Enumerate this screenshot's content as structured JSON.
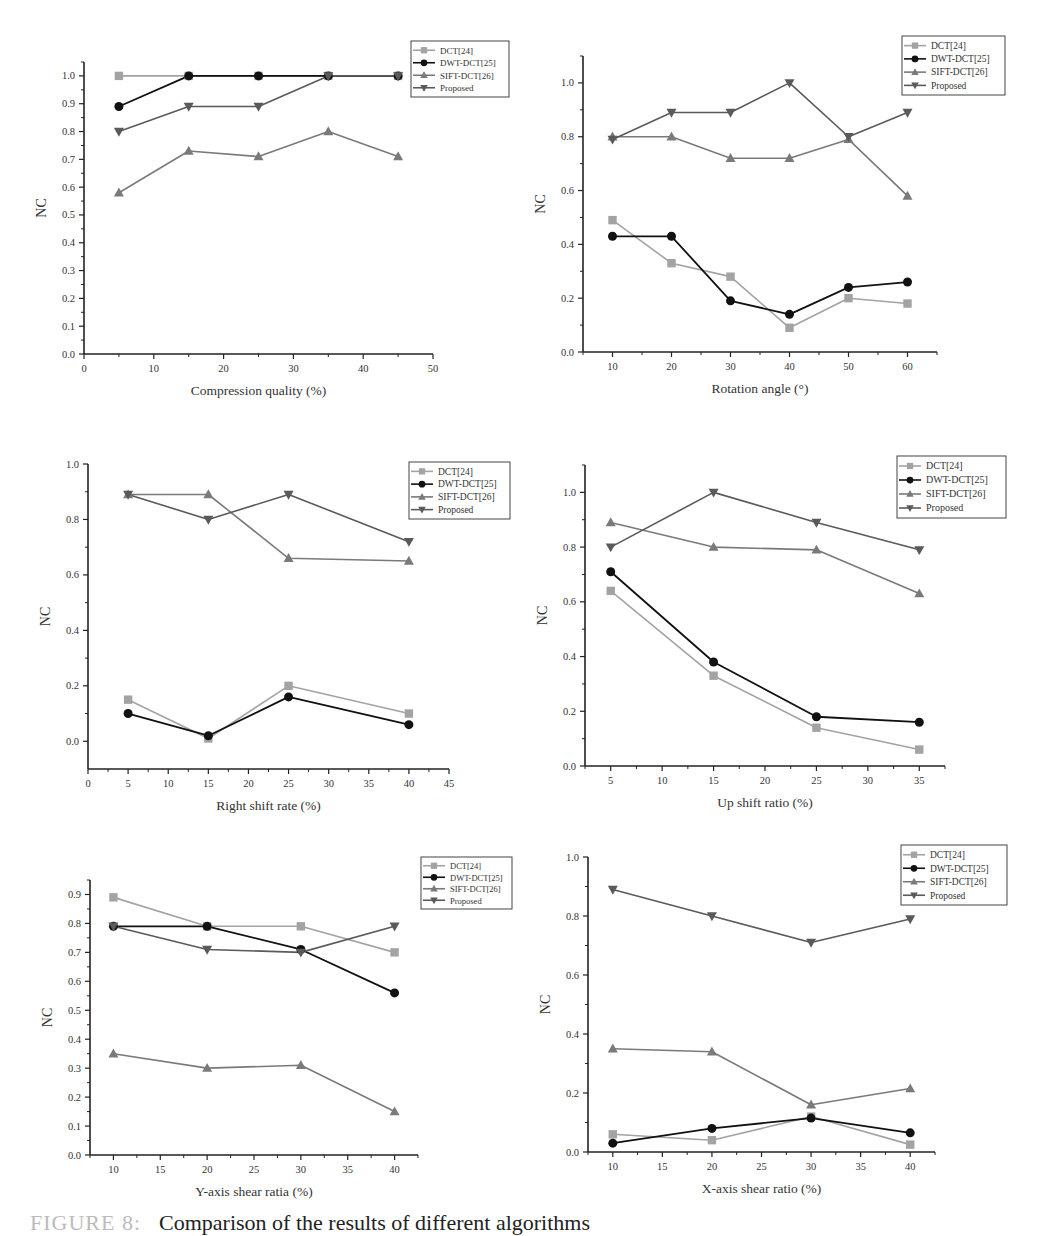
{
  "figure": {
    "caption_label": "FIGURE 8:",
    "caption_text": "Comparison of the results of different algorithms"
  },
  "legend_labels": [
    "DCT[24]",
    "DWT-DCT[25]",
    "SIFT-DCT[26]",
    "Proposed"
  ],
  "series_styles": [
    {
      "name": "DCT[24]",
      "color": "#a3a3a3",
      "marker": "square"
    },
    {
      "name": "DWT-DCT[25]",
      "color": "#111111",
      "marker": "circle"
    },
    {
      "name": "SIFT-DCT[26]",
      "color": "#7a7a7a",
      "marker": "triangle-up"
    },
    {
      "name": "Proposed",
      "color": "#5a5a5a",
      "marker": "triangle-down"
    }
  ],
  "chart_data": [
    {
      "type": "line",
      "title": "",
      "xlabel": "Compression quality (%)",
      "ylabel": "NC",
      "x": [
        5,
        15,
        25,
        35,
        45
      ],
      "xlim": [
        0,
        50
      ],
      "xticks": [
        0,
        10,
        20,
        30,
        40,
        50
      ],
      "ylim": [
        0,
        1.05
      ],
      "yticks": [
        0.0,
        0.1,
        0.2,
        0.3,
        0.4,
        0.5,
        0.6,
        0.7,
        0.8,
        0.9,
        1.0
      ],
      "ytick_labels": [
        "0.0",
        "0.1",
        "0.2",
        "0.3",
        "0.4",
        "0.5",
        "0.6",
        "0.7",
        "0.8",
        "0.9",
        "1.0"
      ],
      "grid": false,
      "legend": "top-right",
      "series": [
        {
          "name": "DCT[24]",
          "values": [
            1.0,
            1.0,
            1.0,
            1.0,
            1.0
          ]
        },
        {
          "name": "DWT-DCT[25]",
          "values": [
            0.89,
            1.0,
            1.0,
            1.0,
            1.0
          ]
        },
        {
          "name": "SIFT-DCT[26]",
          "values": [
            0.58,
            0.73,
            0.71,
            0.8,
            0.71
          ]
        },
        {
          "name": "Proposed",
          "values": [
            0.8,
            0.89,
            0.89,
            1.0,
            1.0
          ]
        }
      ]
    },
    {
      "type": "line",
      "title": "",
      "xlabel": "Rotation angle (°)",
      "ylabel": "NC",
      "x": [
        10,
        20,
        30,
        40,
        50,
        60
      ],
      "xlim": [
        5,
        65
      ],
      "xticks": [
        10,
        20,
        30,
        40,
        50,
        60
      ],
      "ylim": [
        0,
        1.1
      ],
      "yticks": [
        0.0,
        0.2,
        0.4,
        0.6,
        0.8,
        1.0
      ],
      "ytick_labels": [
        "0.0",
        "0.2",
        "0.4",
        "0.6",
        "0.8",
        "1.0"
      ],
      "grid": false,
      "legend": "top-right",
      "series": [
        {
          "name": "DCT[24]",
          "values": [
            0.49,
            0.33,
            0.28,
            0.09,
            0.2,
            0.18
          ]
        },
        {
          "name": "DWT-DCT[25]",
          "values": [
            0.43,
            0.43,
            0.19,
            0.14,
            0.24,
            0.26
          ]
        },
        {
          "name": "SIFT-DCT[26]",
          "values": [
            0.8,
            0.8,
            0.72,
            0.72,
            0.79,
            0.58
          ]
        },
        {
          "name": "Proposed",
          "values": [
            0.79,
            0.89,
            0.89,
            1.0,
            0.8,
            0.89
          ]
        }
      ]
    },
    {
      "type": "line",
      "title": "",
      "xlabel": "Right shift rate (%)",
      "ylabel": "NC",
      "x": [
        5,
        15,
        25,
        40
      ],
      "xlim": [
        0,
        45
      ],
      "xticks": [
        0,
        5,
        10,
        15,
        20,
        25,
        30,
        35,
        40,
        45
      ],
      "ylim": [
        -0.1,
        1.0
      ],
      "yticks": [
        0.0,
        0.2,
        0.4,
        0.6,
        0.8,
        1.0
      ],
      "ytick_labels": [
        "0.0",
        "0.2",
        "0.4",
        "0.6",
        "0.8",
        "1.0"
      ],
      "grid": false,
      "legend": "top-right",
      "series": [
        {
          "name": "DCT[24]",
          "values": [
            0.15,
            0.01,
            0.2,
            0.1
          ]
        },
        {
          "name": "DWT-DCT[25]",
          "values": [
            0.1,
            0.02,
            0.16,
            0.06
          ]
        },
        {
          "name": "SIFT-DCT[26]",
          "values": [
            0.89,
            0.89,
            0.66,
            0.65
          ]
        },
        {
          "name": "Proposed",
          "values": [
            0.89,
            0.8,
            0.89,
            0.72
          ]
        }
      ]
    },
    {
      "type": "line",
      "title": "",
      "xlabel": "Up shift ratio (%)",
      "ylabel": "NC",
      "x": [
        5,
        15,
        25,
        35
      ],
      "xlim": [
        2.5,
        37.5
      ],
      "xticks": [
        5,
        10,
        15,
        20,
        25,
        30,
        35
      ],
      "ylim": [
        0,
        1.1
      ],
      "yticks": [
        0.0,
        0.2,
        0.4,
        0.6,
        0.8,
        1.0
      ],
      "ytick_labels": [
        "0.0",
        "0.2",
        "0.4",
        "0.6",
        "0.8",
        "1.0"
      ],
      "grid": false,
      "legend": "top-right",
      "series": [
        {
          "name": "DCT[24]",
          "values": [
            0.64,
            0.33,
            0.14,
            0.06
          ]
        },
        {
          "name": "DWT-DCT[25]",
          "values": [
            0.71,
            0.38,
            0.18,
            0.16
          ]
        },
        {
          "name": "SIFT-DCT[26]",
          "values": [
            0.89,
            0.8,
            0.79,
            0.63
          ]
        },
        {
          "name": "Proposed",
          "values": [
            0.8,
            1.0,
            0.89,
            0.79
          ]
        }
      ]
    },
    {
      "type": "line",
      "title": "",
      "xlabel": "Y-axis shear ratia (%)",
      "ylabel": "NC",
      "x": [
        10,
        20,
        30,
        40
      ],
      "xlim": [
        7.5,
        42.5
      ],
      "xticks": [
        10,
        15,
        20,
        25,
        30,
        35,
        40
      ],
      "ylim": [
        0,
        0.95
      ],
      "yticks": [
        0.0,
        0.1,
        0.2,
        0.3,
        0.4,
        0.5,
        0.6,
        0.7,
        0.8,
        0.9
      ],
      "ytick_labels": [
        "0.0",
        "0.1",
        "0.2",
        "0.3",
        "0.4",
        "0.5",
        "0.6",
        "0.7",
        "0.8",
        "0.9"
      ],
      "grid": false,
      "legend": "top-right",
      "series": [
        {
          "name": "DCT[24]",
          "values": [
            0.89,
            0.79,
            0.79,
            0.7
          ]
        },
        {
          "name": "DWT-DCT[25]",
          "values": [
            0.79,
            0.79,
            0.71,
            0.56
          ]
        },
        {
          "name": "SIFT-DCT[26]",
          "values": [
            0.35,
            0.3,
            0.31,
            0.15
          ]
        },
        {
          "name": "Proposed",
          "values": [
            0.79,
            0.71,
            0.7,
            0.79
          ]
        }
      ]
    },
    {
      "type": "line",
      "title": "",
      "xlabel": "X-axis shear ratio (%)",
      "ylabel": "NC",
      "x": [
        10,
        20,
        30,
        40
      ],
      "xlim": [
        7.5,
        42.5
      ],
      "xticks": [
        10,
        15,
        20,
        25,
        30,
        35,
        40
      ],
      "ylim": [
        0,
        1.0
      ],
      "yticks": [
        0.0,
        0.2,
        0.4,
        0.6,
        0.8,
        1.0
      ],
      "ytick_labels": [
        "0.0",
        "0.2",
        "0.4",
        "0.6",
        "0.8",
        "1.0"
      ],
      "grid": false,
      "legend": "top-right",
      "series": [
        {
          "name": "DCT[24]",
          "values": [
            0.06,
            0.04,
            0.12,
            0.025
          ]
        },
        {
          "name": "DWT-DCT[25]",
          "values": [
            0.03,
            0.08,
            0.115,
            0.065
          ]
        },
        {
          "name": "SIFT-DCT[26]",
          "values": [
            0.35,
            0.34,
            0.16,
            0.215
          ]
        },
        {
          "name": "Proposed",
          "values": [
            0.89,
            0.8,
            0.71,
            0.79
          ]
        }
      ]
    }
  ]
}
